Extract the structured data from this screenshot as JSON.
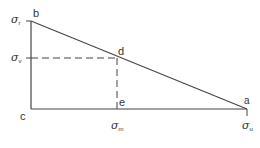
{
  "diagram": {
    "points": {
      "a": {
        "label": "a",
        "x": 247,
        "y": 109
      },
      "b": {
        "label": "b",
        "x": 31,
        "y": 21
      },
      "c": {
        "label": "c",
        "x": 31,
        "y": 109
      },
      "d": {
        "label": "d",
        "x": 117,
        "y": 58
      },
      "e": {
        "label": "e",
        "x": 117,
        "y": 109
      }
    },
    "axis_labels": {
      "sigma_r": {
        "symbol": "σ",
        "sub": "r"
      },
      "sigma_v": {
        "symbol": "σ",
        "sub": "v"
      },
      "sigma_m": {
        "symbol": "σ",
        "sub": "m"
      },
      "sigma_u": {
        "symbol": "σ",
        "sub": "u"
      }
    },
    "line_color": "#444444"
  }
}
